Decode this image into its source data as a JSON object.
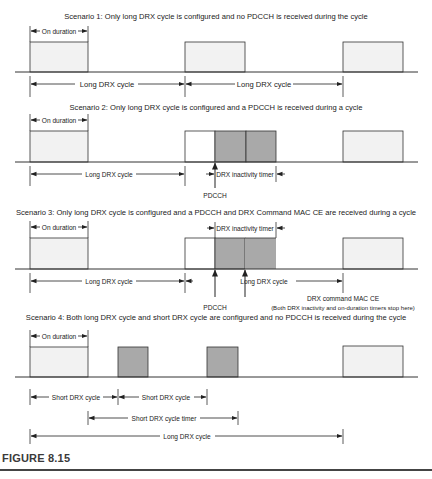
{
  "figure": {
    "label": "FIGURE 8.15",
    "colors": {
      "on_duration_fill": "#f2f2f2",
      "active_fill": "#a9a9a9",
      "line": "#333333"
    }
  },
  "scenarios": [
    {
      "title": "Scenario 1: Only long DRX cycle is configured and no PDCCH is received during the cycle",
      "on_duration": "On duration",
      "labels": [
        "Long DRX cycle",
        "Long DRX cycle"
      ]
    },
    {
      "title": "Scenario 2: Only long DRX cycle is configured and a PDCCH is received during a cycle",
      "on_duration": "On duration",
      "labels": [
        "Long DRX cycle"
      ],
      "inactivity_timer": "DRX inactivity timer",
      "pdcch": "PDCCH"
    },
    {
      "title": "Scenario 3: Only long DRX cycle is configured and a PDCCH and DRX Command MAC CE are received during a cycle",
      "on_duration": "On duration",
      "labels": [
        "Long DRX cycle"
      ],
      "inactivity_timer": "DRX inactivity timer",
      "pdcch": "PDCCH",
      "mac_ce": "DRX command MAC CE",
      "mac_ce_note": "(Both DRX inactivity and on-duration timers stop here)"
    },
    {
      "title": "Scenario 4: Both long DRX cycle and short DRX cycle are configured and no PDCCH is received during the cycle",
      "on_duration": "On duration",
      "short_cycle": "Short DRX cycle",
      "short_cycle_2": "Short DRX cycle",
      "short_timer": "Short DRX cycle timer",
      "long_cycle": "Long DRX cycle"
    }
  ]
}
